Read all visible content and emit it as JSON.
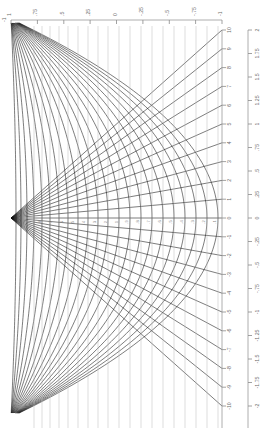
{
  "figure": {
    "kind": "conformal-coordinate-grid",
    "background": "#ffffff",
    "curve_color": "#111111",
    "axis_color": "#9a9a9a",
    "label_color": "#6a6a6a",
    "label_rotation_deg": -90
  },
  "axes": {
    "top": {
      "name": "top-horizontal-axis",
      "orientation": "horizontal",
      "position_y": 20,
      "x_start": 11,
      "x_end": 222,
      "direction": "decreasing-left-to-right",
      "corner_label": "-1",
      "ticks": [
        {
          "label": "1",
          "value": 1,
          "x": 11
        },
        {
          "label": ".75",
          "value": 0.75,
          "x": 37.4
        },
        {
          "label": ".5",
          "value": 0.5,
          "x": 63.8
        },
        {
          "label": ".25",
          "value": 0.25,
          "x": 90.1
        },
        {
          "label": "0",
          "value": 0,
          "x": 116.5
        },
        {
          "label": "-.25",
          "value": -0.25,
          "x": 142.9
        },
        {
          "label": "-.5",
          "value": -0.5,
          "x": 169.3
        },
        {
          "label": "-.75",
          "value": -0.75,
          "x": 195.6
        },
        {
          "label": "-1",
          "value": -1,
          "x": 222
        }
      ]
    },
    "right_inner": {
      "name": "right-inner-vertical-axis",
      "orientation": "vertical",
      "position_x": 222,
      "y_top": 30,
      "y_bottom": 428,
      "zero_y": 218,
      "ticks": [
        {
          "label": "10",
          "value": 10,
          "y": 30.0
        },
        {
          "label": "9",
          "value": 9,
          "y": 48.8
        },
        {
          "label": "8",
          "value": 8,
          "y": 67.6
        },
        {
          "label": "7",
          "value": 7,
          "y": 86.4
        },
        {
          "label": "6",
          "value": 6,
          "y": 105.2
        },
        {
          "label": "5",
          "value": 5,
          "y": 124.0
        },
        {
          "label": "4",
          "value": 4,
          "y": 142.8
        },
        {
          "label": "3",
          "value": 3,
          "y": 161.6
        },
        {
          "label": "2",
          "value": 2,
          "y": 180.4
        },
        {
          "label": "1",
          "value": 1,
          "y": 199.2
        },
        {
          "label": "0",
          "value": 0,
          "y": 218.0
        },
        {
          "label": "-1",
          "value": -1,
          "y": 236.8
        },
        {
          "label": "-2",
          "value": -2,
          "y": 255.6
        },
        {
          "label": "-3",
          "value": -3,
          "y": 274.4
        },
        {
          "label": "-4",
          "value": -4,
          "y": 293.2
        },
        {
          "label": "-5",
          "value": -5,
          "y": 312.0
        },
        {
          "label": "-6",
          "value": -6,
          "y": 330.8
        },
        {
          "label": "-7",
          "value": -7,
          "y": 349.6
        },
        {
          "label": "-8",
          "value": -8,
          "y": 368.4
        },
        {
          "label": "-9",
          "value": -9,
          "y": 387.2
        },
        {
          "label": "-10",
          "value": -10,
          "y": 406.0
        }
      ]
    },
    "right_outer": {
      "name": "right-outer-vertical-axis",
      "orientation": "vertical",
      "position_x": 248,
      "y_top": 30,
      "y_bottom": 428,
      "zero_y": 218,
      "ticks": [
        {
          "label": "2",
          "value": 2.0,
          "y": 30.0
        },
        {
          "label": "1.75",
          "value": 1.75,
          "y": 53.5
        },
        {
          "label": "1.5",
          "value": 1.5,
          "y": 77.0
        },
        {
          "label": "1.25",
          "value": 1.25,
          "y": 100.5
        },
        {
          "label": "1",
          "value": 1.0,
          "y": 124.0
        },
        {
          "label": ".75",
          "value": 0.75,
          "y": 147.5
        },
        {
          "label": ".5",
          "value": 0.5,
          "y": 171.0
        },
        {
          "label": ".25",
          "value": 0.25,
          "y": 194.5
        },
        {
          "label": "0",
          "value": 0.0,
          "y": 218.0
        },
        {
          "label": "-.25",
          "value": -0.25,
          "y": 241.5
        },
        {
          "label": "-.5",
          "value": -0.5,
          "y": 265.0
        },
        {
          "label": "-.75",
          "value": -0.75,
          "y": 288.5
        },
        {
          "label": "-1",
          "value": -1.0,
          "y": 312.0
        },
        {
          "label": "-1.25",
          "value": -1.25,
          "y": 335.5
        },
        {
          "label": "-1.5",
          "value": -1.5,
          "y": 359.0
        },
        {
          "label": "-1.75",
          "value": -1.75,
          "y": 382.5
        },
        {
          "label": "-2",
          "value": -2.0,
          "y": 406.0
        }
      ]
    },
    "center_row": {
      "name": "center-row-inline-labels",
      "y": 222,
      "labels": [
        "9",
        "8",
        "7",
        "6",
        "5",
        "4",
        "3",
        "2",
        "1",
        ".9",
        ".8",
        ".7",
        ".6",
        ".5",
        ".4",
        ".3",
        ".2",
        ".1"
      ]
    }
  },
  "chart_data": {
    "type": "line",
    "title": "",
    "xlabel": "",
    "ylabel": "",
    "xlim": [
      1,
      -1
    ],
    "ylim": [
      -2,
      2
    ],
    "grid": true,
    "legend": null,
    "apex": {
      "x": 11,
      "y": 218
    },
    "family_rays": {
      "name": "radial-ray-family",
      "count": 21,
      "origin": [
        11,
        218
      ],
      "end_x": 222,
      "end_y_values": [
        30,
        48.8,
        67.6,
        86.4,
        105.2,
        124.0,
        142.8,
        161.6,
        180.4,
        199.2,
        218.0,
        236.8,
        255.6,
        274.4,
        293.2,
        312.0,
        330.8,
        349.6,
        368.4,
        387.2,
        406.0
      ]
    },
    "family_arcs": {
      "name": "parabolic-arc-family",
      "count": 22,
      "vertex_xs": [
        16,
        21,
        27,
        34,
        42,
        50,
        59,
        68,
        78,
        88,
        98,
        108,
        119,
        130,
        141,
        152,
        163,
        174,
        185,
        196,
        207,
        218
      ],
      "opens": "right"
    }
  }
}
